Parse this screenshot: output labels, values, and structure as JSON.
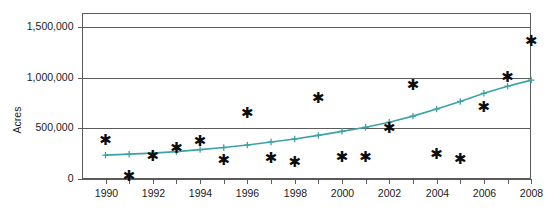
{
  "chart_data": {
    "type": "scatter",
    "title": "",
    "xlabel": "",
    "ylabel": "Acres",
    "xlim": [
      1989.5,
      2008.6
    ],
    "ylim": [
      0,
      1650000
    ],
    "grid": true,
    "legend": "none",
    "x_ticks": [
      1990,
      1991,
      1992,
      1993,
      1994,
      1995,
      1996,
      1997,
      1998,
      1999,
      2000,
      2001,
      2002,
      2003,
      2004,
      2005,
      2006,
      2007,
      2008
    ],
    "x_tick_labels": [
      "1990",
      "",
      "1992",
      "",
      "1994",
      "",
      "1996",
      "",
      "1998",
      "",
      "2000",
      "",
      "2002",
      "",
      "2004",
      "",
      "2006",
      "",
      "2008"
    ],
    "y_ticks": [
      0,
      500000,
      1000000,
      1500000
    ],
    "y_tick_labels": [
      "0",
      "500,000",
      "1,000,000",
      "1,500,000"
    ],
    "series": [
      {
        "name": "Annual acres",
        "marker": "asterisk",
        "color": "#0d0d0d",
        "x": [
          1990,
          1991,
          1992,
          1993,
          1994,
          1995,
          1996,
          1997,
          1998,
          1999,
          2000,
          2001,
          2002,
          2003,
          2004,
          2005,
          2006,
          2007,
          2008
        ],
        "values": [
          380000,
          20000,
          220000,
          305000,
          370000,
          185000,
          650000,
          200000,
          165000,
          795000,
          215000,
          215000,
          495000,
          920000,
          240000,
          195000,
          710000,
          1005000,
          1355000
        ]
      },
      {
        "name": "Trend",
        "marker": "plus",
        "color": "#3ba3a8",
        "x": [
          1990,
          1991,
          1992,
          1993,
          1994,
          1995,
          1996,
          1997,
          1998,
          1999,
          2000,
          2001,
          2002,
          2003,
          2004,
          2005,
          2006,
          2007,
          2008
        ],
        "values": [
          235000,
          245000,
          255000,
          270000,
          290000,
          310000,
          335000,
          365000,
          395000,
          430000,
          470000,
          510000,
          560000,
          620000,
          690000,
          765000,
          845000,
          915000,
          975000
        ]
      }
    ]
  },
  "axis": {
    "y_title": "Acres"
  }
}
